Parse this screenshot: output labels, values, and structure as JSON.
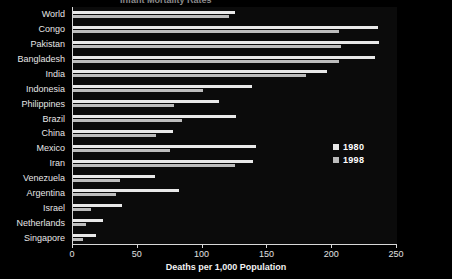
{
  "chart_data": {
    "type": "bar",
    "orientation": "horizontal",
    "title": "Infant Mortality Rates",
    "xlabel": "Deaths per 1,000 Population",
    "ylabel": "",
    "xlim": [
      0,
      250
    ],
    "xticks": [
      0,
      50,
      100,
      150,
      200,
      250
    ],
    "xticklabels": [
      "0",
      "50",
      "100",
      "150",
      "200",
      "250"
    ],
    "grid": false,
    "legend_position": "center-right",
    "categories": [
      "World",
      "Congo",
      "Pakistan",
      "Bangladesh",
      "India",
      "Indonesia",
      "Philippines",
      "Brazil",
      "China",
      "Mexico",
      "Iran",
      "Venezuela",
      "Argentina",
      "Israel",
      "Netherlands",
      "Singapore"
    ],
    "series": [
      {
        "name": "1980",
        "color": "#e9e9e9",
        "values": [
          125,
          235,
          236,
          233,
          196,
          138,
          113,
          126,
          77,
          141,
          139,
          63,
          82,
          38,
          23,
          18
        ]
      },
      {
        "name": "1998",
        "color": "#bdbdbd",
        "values": [
          120,
          205,
          207,
          205,
          180,
          100,
          78,
          84,
          64,
          75,
          125,
          36,
          33,
          14,
          10,
          8
        ]
      }
    ]
  },
  "legend": {
    "entries": [
      {
        "label": "1980"
      },
      {
        "label": "1998"
      }
    ]
  },
  "axis": {
    "x_title": "Deaths per 1,000 Population"
  },
  "colors": {
    "background": "#000000",
    "plot_background": "#0b0b0b",
    "axis": "#d8d8d8",
    "text": "#ffffff",
    "series_1980": "#e9e9e9",
    "series_1998": "#bdbdbd"
  }
}
